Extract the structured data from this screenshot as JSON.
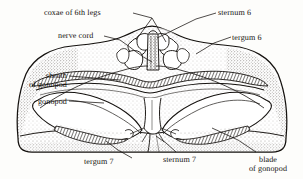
{
  "figure": {
    "style": "stippled pen-and-ink scientific line drawing",
    "background_color": "#fdfdfb",
    "ink_color": "#15120f"
  },
  "labels": {
    "coxae": "coxae of 6th legs",
    "sternum6": "sternum 6",
    "nerve_cord": "nerve cord",
    "tergum6": "tergum 6",
    "sheath_line1": "sheath",
    "sheath_line2": "of gonopod",
    "gonopod": "gonopod",
    "tergum7": "tergum 7",
    "sternum7": "sternum 7",
    "blade_line1": "blade",
    "blade_line2": "of gonopod"
  }
}
